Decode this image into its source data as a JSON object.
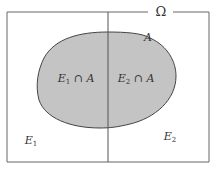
{
  "diagram": {
    "type": "venn-partition",
    "universe_label": "Ω",
    "set_label": "A",
    "regions": [
      {
        "name": "E1",
        "label": "E",
        "sub": "1"
      },
      {
        "name": "E2",
        "label": "E",
        "sub": "2"
      }
    ],
    "intersections": [
      {
        "name": "E1-cap-A",
        "label": "E",
        "sub": "1",
        "op": " ∩ ",
        "set": "A"
      },
      {
        "name": "E2-cap-A",
        "label": "E",
        "sub": "2",
        "op": " ∩ ",
        "set": "A"
      }
    ],
    "colors": {
      "border": "#555555",
      "fill": "#c4c4c4",
      "text": "#333333",
      "background": "#ffffff"
    }
  }
}
